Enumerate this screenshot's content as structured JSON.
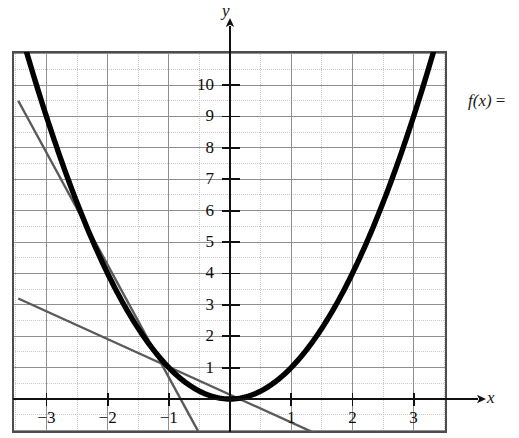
{
  "figure": {
    "kind": "math-graph",
    "background": "#ffffff"
  },
  "labels": {
    "y_axis": "y",
    "x_axis": "x",
    "formula": "f(x) ="
  },
  "colors": {
    "curve": "#000000",
    "secant": "#5a5a5a",
    "axis": "#1a1a1a",
    "grid_major": "#8f8f8f",
    "grid_minor": "#c9c9c9",
    "frame": "#4d4d4d",
    "text": "#0d0d0d"
  },
  "chart_data": {
    "type": "line",
    "title": "",
    "xlabel": "x",
    "ylabel": "y",
    "xlim": [
      -3.55,
      3.55
    ],
    "ylim": [
      -1.05,
      11.1
    ],
    "grid": true,
    "grid_major_step": 1,
    "grid_minor_step": 0.5,
    "legend": "none",
    "xticks": [
      -3,
      -2,
      -1,
      1,
      2,
      3
    ],
    "xtick_labels": [
      "−3",
      "−2",
      "−1",
      "1",
      "2",
      "3"
    ],
    "yticks": [
      1,
      2,
      3,
      4,
      5,
      6,
      7,
      8,
      9,
      10
    ],
    "ytick_labels": [
      "1",
      "2",
      "3",
      "4",
      "5",
      "6",
      "7",
      "8",
      "9",
      "10"
    ],
    "series": [
      {
        "name": "f(x) = x^2",
        "type": "parabola",
        "style": "solid",
        "width": 5,
        "color": "#000000",
        "a": 1,
        "h": 0,
        "k": 0,
        "x_start": -3.42,
        "x_end": 3.42,
        "points": [
          [
            -3.4,
            11.56
          ],
          [
            -3.0,
            9.0
          ],
          [
            -2.5,
            6.25
          ],
          [
            -2.0,
            4.0
          ],
          [
            -1.5,
            2.25
          ],
          [
            -1.0,
            1.0
          ],
          [
            -0.5,
            0.25
          ],
          [
            0.0,
            0.0
          ],
          [
            0.5,
            0.25
          ],
          [
            1.0,
            1.0
          ],
          [
            1.5,
            2.25
          ],
          [
            2.0,
            4.0
          ],
          [
            2.5,
            6.25
          ],
          [
            3.0,
            9.0
          ],
          [
            3.4,
            11.56
          ]
        ]
      },
      {
        "name": "steep secant line",
        "type": "segment",
        "style": "solid",
        "width": 2,
        "color": "#5a5a5a",
        "slope": -3.6,
        "points": [
          [
            -3.46,
            9.5
          ],
          [
            -0.5,
            -1.1
          ]
        ]
      },
      {
        "name": "shallow secant line",
        "type": "segment",
        "style": "solid",
        "width": 2,
        "color": "#5a5a5a",
        "slope": -1.1,
        "points": [
          [
            -3.46,
            3.2
          ],
          [
            1.4,
            -1.1
          ]
        ]
      }
    ]
  }
}
